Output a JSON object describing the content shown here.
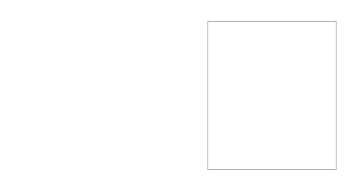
{
  "figure": {
    "title": "",
    "type": "diagram",
    "width": 356,
    "height": 191,
    "background": "#ffffff"
  },
  "palette": {
    "white": "#ffffff",
    "very_light": "#f4f4f4",
    "light": "#eaeaea",
    "light_mid": "#e0e0e0",
    "mid": "#d2d2d2",
    "mid_dark": "#c2c2c2",
    "dark_gray": "#b4b4b4",
    "darker": "#a0a0a0",
    "darkest": "#585858",
    "outline": "#6b6b6b",
    "dash": "#4a4a4a",
    "border": "#9a9a9a"
  },
  "style": {
    "band_outline_width": 0.7,
    "dash_width": 0.8,
    "dash_pattern": "2.6 2.2",
    "border_width": 0.8
  },
  "panels": [
    {
      "name": "left-panel",
      "label": "Panel A",
      "x": 0,
      "y": 0,
      "width": 178,
      "height": 191,
      "rotation_deg": 45,
      "square_side": 176,
      "cx": 88,
      "cy": 95,
      "band_count_per_quadrant": 9,
      "show_border": false,
      "quadrants": [
        {
          "name": "top",
          "direction": "down-right",
          "shades": [
            "#eeeeee",
            "#e2e2e2",
            "#f2f2f2",
            "#d2d2d2",
            "#ececec",
            "#c8c8c8",
            "#e6e6e6",
            "#d8d8d8",
            "#585858"
          ]
        },
        {
          "name": "right",
          "direction": "down-left",
          "shades": [
            "#f4f4f4",
            "#e8e8e8",
            "#dcdcdc",
            "#f0f0f0",
            "#cccccc",
            "#e4e4e4",
            "#d6d6d6",
            "#eeeeee",
            "#e0e0e0"
          ]
        },
        {
          "name": "bottom",
          "direction": "up-left",
          "shades": [
            "#ececec",
            "#dedede",
            "#f2f2f2",
            "#cfcfcf",
            "#e8e8e8",
            "#c4c4c4",
            "#e2e2e2",
            "#d4d4d4",
            "#585858"
          ]
        },
        {
          "name": "left",
          "direction": "up-right",
          "shades": [
            "#f2f2f2",
            "#e6e6e6",
            "#dadada",
            "#eeeeee",
            "#cacaca",
            "#e2e2e2",
            "#d4d4d4",
            "#ececec",
            "#dedede"
          ]
        }
      ]
    },
    {
      "name": "right-panel",
      "label": "Panel B",
      "x": 196,
      "y": 8,
      "width": 152,
      "height": 175,
      "rotation_deg": 0,
      "square_side": 152,
      "cx": 76,
      "cy": 87,
      "band_count_per_quadrant": 9,
      "show_border": true,
      "quadrants": [
        {
          "name": "top",
          "direction": "down-right",
          "shades": [
            "#f6f6f6",
            "#e4e4e4",
            "#d0d0d0",
            "#eeeeee",
            "#c6c6c6",
            "#e8e8e8",
            "#d8d8d8",
            "#f0f0f0",
            "#585858"
          ]
        },
        {
          "name": "right",
          "direction": "down-left",
          "shades": [
            "#585858",
            "#f8f8f8",
            "#eaeaea",
            "#dcdcdc",
            "#f2f2f2",
            "#cecece",
            "#e6e6e6",
            "#d6d6d6",
            "#efefef"
          ]
        },
        {
          "name": "bottom",
          "direction": "up-left",
          "shades": [
            "#f4f4f4",
            "#e2e2e2",
            "#cfcfcf",
            "#ececec",
            "#c4c4c4",
            "#e6e6e6",
            "#d6d6d6",
            "#eeeeee",
            "#585858"
          ]
        },
        {
          "name": "left",
          "direction": "up-right",
          "shades": [
            "#f2f2f2",
            "#e8e8e8",
            "#d2d2d2",
            "#fafafa",
            "#caccca",
            "#e4e4e4",
            "#dadada",
            "#f0f0f0",
            "#e0e0e0"
          ]
        }
      ]
    }
  ]
}
